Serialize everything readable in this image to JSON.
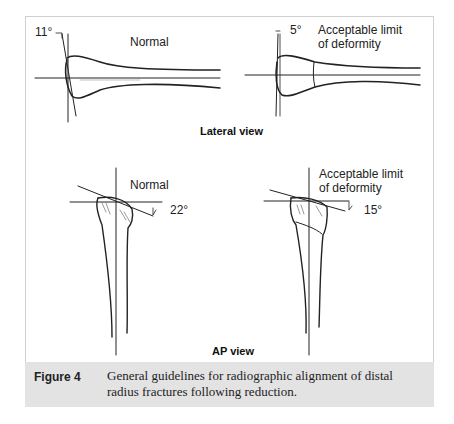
{
  "figure": {
    "lateral": {
      "view_label": "Lateral view",
      "normal": {
        "label": "Normal",
        "angle": "11°"
      },
      "limit": {
        "label_line1": "Acceptable limit",
        "label_line2": "of deformity",
        "angle": "5°"
      }
    },
    "ap": {
      "view_label": "AP view",
      "normal": {
        "label": "Normal",
        "angle": "22°"
      },
      "limit": {
        "label_line1": "Acceptable limit",
        "label_line2": "of deformity",
        "angle": "15°"
      }
    }
  },
  "caption": {
    "label": "Figure 4",
    "text": "General guidelines for radiographic alignment of distal radius fractures following reduction."
  }
}
